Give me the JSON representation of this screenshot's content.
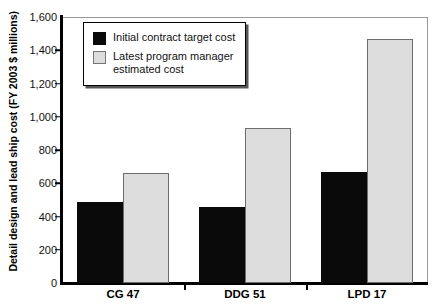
{
  "chart_data": {
    "type": "bar",
    "title": "",
    "subtitle": "",
    "xlabel": "",
    "ylabel": "Detail design and lead ship cost\n(FY 2003 $ millions)",
    "categories": [
      "CG 47",
      "DDG 51",
      "LPD 17"
    ],
    "series": [
      {
        "name": "Initial contract target cost",
        "color": "#0a0a0a",
        "values": [
          485,
          455,
          670
        ]
      },
      {
        "name": "Latest program manager estimated cost",
        "color": "#dddddd",
        "values": [
          660,
          935,
          1465
        ]
      }
    ],
    "ylim": [
      0,
      1600
    ],
    "ytick_step": 200,
    "ytick_labels": [
      "0",
      "200",
      "400",
      "600",
      "800",
      "1,000",
      "1,200",
      "1,400",
      "1,600"
    ],
    "ytick_values": [
      0,
      200,
      400,
      600,
      800,
      1000,
      1200,
      1400,
      1600
    ],
    "grid": false,
    "legend_position": "top-left"
  },
  "legend": {
    "items": [
      {
        "label": "Initial contract target cost",
        "swatch": "dark"
      },
      {
        "label": "Latest program manager\nestimated cost",
        "swatch": "light"
      }
    ]
  },
  "axis": {
    "y_title": "Detail design and lead ship cost\n(FY 2003 $ millions)"
  }
}
